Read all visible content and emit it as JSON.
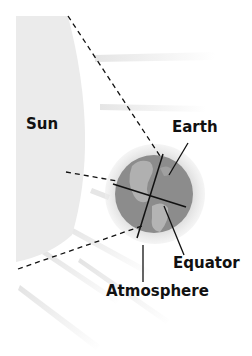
{
  "figure": {
    "title_fragment": "",
    "colors": {
      "sun_fill": "#ebebeb",
      "earth_fill": "#8c8c8c",
      "earth_land": "#b4b4b4",
      "atmosphere_fill": "#dcdcdc",
      "ray_color": "#e4e4e4",
      "line_color": "#111111",
      "background": "#ffffff"
    }
  },
  "labels": {
    "sun": "Sun",
    "earth": "Earth",
    "equator": "Equator",
    "atmosphere": "Atmosphere"
  }
}
